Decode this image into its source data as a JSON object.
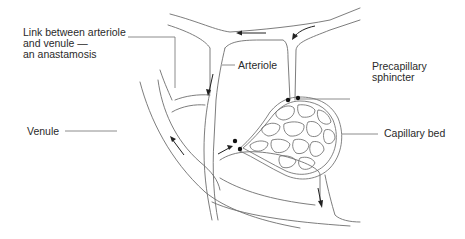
{
  "labels": {
    "anastomosis": "Link between arteriole\nand venule —\nan anastamosis",
    "arteriole": "Arteriole",
    "precapillary_sphincter": "Precapillary\nsphincter",
    "venule": "Venule",
    "capillary_bed": "Capillary bed"
  },
  "colors": {
    "line": "#6e6e6e",
    "text": "#2a2a2a",
    "arrow": "#222222"
  }
}
